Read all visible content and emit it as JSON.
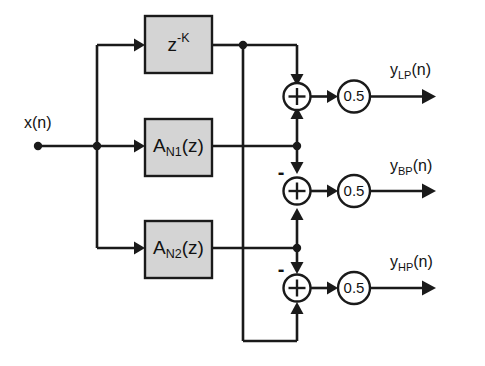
{
  "diagram": {
    "type": "signal-flow-block-diagram",
    "background_color": "#ffffff",
    "line_color": "#1a1a1a",
    "block_fill_color": "#d4d4d4",
    "input": {
      "label_main": "x",
      "label_paren": "(n)",
      "full_label": "x(n)"
    },
    "blocks": [
      {
        "id": "delay",
        "label_base": "z",
        "label_exponent": "-K",
        "full_label": "z^-K"
      },
      {
        "id": "allpass1",
        "label_base": "A",
        "label_subscript": "N1",
        "label_arg": "(z)",
        "full_label": "A_N1(z)"
      },
      {
        "id": "allpass2",
        "label_base": "A",
        "label_subscript": "N2",
        "label_arg": "(z)",
        "full_label": "A_N2(z)"
      }
    ],
    "adders": [
      {
        "id": "adder-lp",
        "symbol": "+",
        "sign_annotation": ""
      },
      {
        "id": "adder-bp",
        "symbol": "+",
        "sign_annotation": "-"
      },
      {
        "id": "adder-hp",
        "symbol": "+",
        "sign_annotation": "-"
      }
    ],
    "gains": [
      {
        "id": "gain-lp",
        "value": "0.5"
      },
      {
        "id": "gain-bp",
        "value": "0.5"
      },
      {
        "id": "gain-hp",
        "value": "0.5"
      }
    ],
    "outputs": [
      {
        "id": "output-lp",
        "label_base": "y",
        "label_subscript": "LP",
        "label_arg": "(n)",
        "full_label": "y_LP(n)"
      },
      {
        "id": "output-bp",
        "label_base": "y",
        "label_subscript": "BP",
        "label_arg": "(n)",
        "full_label": "y_BP(n)"
      },
      {
        "id": "output-hp",
        "label_base": "y",
        "label_subscript": "HP",
        "label_arg": "(n)",
        "full_label": "y_HP(n)"
      }
    ]
  }
}
